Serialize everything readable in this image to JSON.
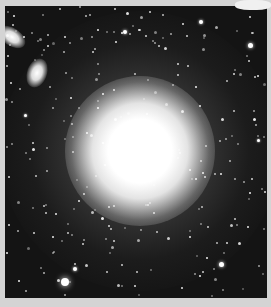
{
  "image": {
    "subject": "elliptical galaxy",
    "background_color": "#141414",
    "border_color": "#d4d4d4",
    "core": {
      "cx": 135,
      "cy": 145,
      "core_radius": 45,
      "halo_radius": 140
    },
    "companions": [
      {
        "cx": 10,
        "cy": 37,
        "rx": 12,
        "ry": 7,
        "rot": 35
      },
      {
        "cx": 33,
        "cy": 70,
        "rx": 8,
        "ry": 12,
        "rot": 20
      }
    ],
    "bright_stars": [
      {
        "x": 65,
        "y": 282,
        "r": 4
      },
      {
        "x": 250,
        "y": 45,
        "r": 2.5
      },
      {
        "x": 221,
        "y": 264,
        "r": 2.5
      },
      {
        "x": 125,
        "y": 32,
        "r": 2
      },
      {
        "x": 75,
        "y": 269,
        "r": 2
      },
      {
        "x": 201,
        "y": 22,
        "r": 2
      },
      {
        "x": 25,
        "y": 115,
        "r": 1.5
      },
      {
        "x": 258,
        "y": 140,
        "r": 1.5
      }
    ]
  }
}
